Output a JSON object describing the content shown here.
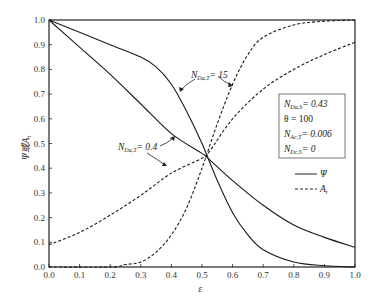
{
  "chart_data": {
    "type": "line",
    "title": "",
    "xlabel": "ε",
    "ylabel": "Ψ或A_t",
    "xlim": [
      0.0,
      1.0
    ],
    "ylim": [
      0.0,
      1.0
    ],
    "x_ticks": [
      "0.0",
      "0.1",
      "0.2",
      "0.3",
      "0.4",
      "0.5",
      "0.6",
      "0.7",
      "0.8",
      "0.9",
      "1.0"
    ],
    "y_ticks": [
      "0.0",
      "0.1",
      "0.2",
      "0.3",
      "0.4",
      "0.5",
      "0.6",
      "0.7",
      "0.8",
      "0.9",
      "1.0"
    ],
    "grid": false,
    "series": [
      {
        "name": "Ψ (N_Da,T = 15)",
        "style": "solid",
        "x": [
          0.0,
          0.1,
          0.2,
          0.3,
          0.35,
          0.4,
          0.45,
          0.5,
          0.55,
          0.6,
          0.65,
          0.7,
          0.8,
          0.9,
          1.0
        ],
        "y": [
          1.0,
          0.95,
          0.9,
          0.85,
          0.81,
          0.74,
          0.63,
          0.5,
          0.35,
          0.22,
          0.13,
          0.07,
          0.02,
          0.005,
          0.0
        ]
      },
      {
        "name": "Ψ (N_Da,T = 0.4)",
        "style": "solid",
        "x": [
          0.0,
          0.1,
          0.2,
          0.3,
          0.4,
          0.5,
          0.52,
          0.6,
          0.7,
          0.8,
          0.9,
          1.0
        ],
        "y": [
          1.0,
          0.89,
          0.78,
          0.66,
          0.54,
          0.46,
          0.44,
          0.35,
          0.25,
          0.17,
          0.12,
          0.08
        ]
      },
      {
        "name": "A_t (N_Da,T = 0.4)",
        "style": "dashed",
        "x": [
          0.0,
          0.1,
          0.2,
          0.3,
          0.4,
          0.5,
          0.52,
          0.6,
          0.7,
          0.8,
          0.9,
          1.0
        ],
        "y": [
          0.09,
          0.14,
          0.21,
          0.29,
          0.38,
          0.44,
          0.46,
          0.6,
          0.72,
          0.8,
          0.86,
          0.91
        ]
      },
      {
        "name": "A_t (N_Da,T = 15)",
        "style": "dashed",
        "x": [
          0.0,
          0.2,
          0.25,
          0.3,
          0.35,
          0.4,
          0.45,
          0.5,
          0.55,
          0.6,
          0.65,
          0.7,
          0.8,
          0.9,
          1.0
        ],
        "y": [
          0.0,
          0.0,
          0.01,
          0.02,
          0.06,
          0.13,
          0.24,
          0.4,
          0.58,
          0.74,
          0.86,
          0.93,
          0.98,
          0.995,
          1.0
        ]
      }
    ],
    "annotations": [
      {
        "text": "N_Da,T = 15"
      },
      {
        "text": "N_Da,T = 0.4"
      }
    ],
    "parameter_box": [
      "N_Da,S = 0.43",
      "θ = 100",
      "N_Ac,T = 0.006",
      "N_Dc,S = 0"
    ],
    "legend": [
      {
        "label": "Ψ",
        "style": "solid"
      },
      {
        "label": "A_t",
        "style": "dashed"
      }
    ],
    "legend_position": "right-middle"
  },
  "labels": {
    "xlabel": "ε",
    "ylabel_main": "Ψ或",
    "ylabel_A": "A",
    "ylabel_sub": "t",
    "ann_hi_N": "N",
    "ann_hi_sub": "Da,T",
    "ann_hi_val": "= 15",
    "ann_lo_N": "N",
    "ann_lo_sub": "Da,T",
    "ann_lo_val": "= 0.4",
    "box1_N": "N",
    "box1_sub": "Da,S",
    "box1_val": "= 0.43",
    "box2": "θ = 100",
    "box3_N": "N",
    "box3_sub": "Ac,T",
    "box3_val": "= 0.006",
    "box4_N": "N",
    "box4_sub": "Dc,S",
    "box4_val": "= 0",
    "legend_psi": "Ψ",
    "legend_A": "A",
    "legend_A_sub": "t"
  }
}
